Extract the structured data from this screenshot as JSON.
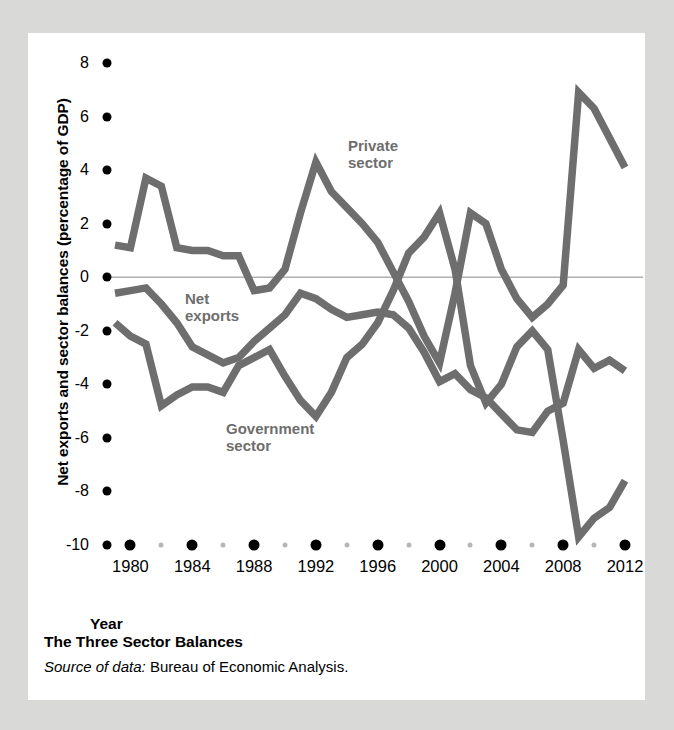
{
  "figure": {
    "caption_title": "The Three Sector Balances",
    "source_prefix": "Source of data:",
    "source_text": " Bureau of Economic Analysis."
  },
  "colors": {
    "page_background": "#d9d9d7",
    "card_background": "#ffffff",
    "line": "#6e6e6e",
    "zero_line": "#b0b0b0",
    "tick": "#000000",
    "minor_tick": "#b6b6b6",
    "annotation": "#6e6e6e"
  },
  "annotations": {
    "private_sector_line1": "Private",
    "private_sector_line2": "sector",
    "net_exports_line1": "Net",
    "net_exports_line2": "exports",
    "government_sector_line1": "Government",
    "government_sector_line2": "sector"
  },
  "chart_data": {
    "type": "line",
    "title": "The Three Sector Balances",
    "xlabel": "Year",
    "ylabel": "Net exports and sector balances (percentage of GDP)",
    "xlim": [
      1979,
      2012
    ],
    "ylim": [
      -10,
      8
    ],
    "ytick_values": [
      8,
      6,
      4,
      2,
      0,
      -2,
      -4,
      -6,
      -8,
      -10
    ],
    "ytick_labels": [
      "8",
      "6",
      "4",
      "2",
      "0",
      "-2",
      "-4",
      "-6",
      "-8",
      "-10"
    ],
    "xtick_major_labels": [
      "1980",
      "1984",
      "1988",
      "1992",
      "1996",
      "2000",
      "2004",
      "2008",
      "2012"
    ],
    "xtick_major_values": [
      1980,
      1984,
      1988,
      1992,
      1996,
      2000,
      2004,
      2008,
      2012
    ],
    "xtick_minor_values": [
      1982,
      1986,
      1990,
      1994,
      1998,
      2002,
      2006,
      2010
    ],
    "grid": false,
    "zero_reference_line": 0,
    "legend": "inline-annotations",
    "x": [
      1979,
      1980,
      1981,
      1982,
      1983,
      1984,
      1985,
      1986,
      1987,
      1988,
      1989,
      1990,
      1991,
      1992,
      1993,
      1994,
      1995,
      1996,
      1997,
      1998,
      1999,
      2000,
      2001,
      2002,
      2003,
      2004,
      2005,
      2006,
      2007,
      2008,
      2009,
      2010,
      2011,
      2012
    ],
    "series": [
      {
        "name": "Private sector",
        "values": [
          1.2,
          1.1,
          3.7,
          3.4,
          1.1,
          1.0,
          1.0,
          0.8,
          0.8,
          -0.5,
          -0.4,
          0.3,
          2.4,
          4.3,
          3.2,
          2.6,
          2.0,
          1.3,
          0.2,
          -0.9,
          -2.2,
          -3.2,
          -0.6,
          2.4,
          2.0,
          0.3,
          -0.8,
          -1.5,
          -1.0,
          -0.3,
          6.9,
          6.3,
          5.2,
          4.1
        ]
      },
      {
        "name": "Net exports",
        "values": [
          -0.6,
          -0.5,
          -0.4,
          -1.0,
          -1.7,
          -2.6,
          -2.9,
          -3.2,
          -3.0,
          -2.4,
          -1.9,
          -1.4,
          -0.6,
          -0.8,
          -1.2,
          -1.5,
          -1.4,
          -1.3,
          -1.4,
          -1.9,
          -2.8,
          -3.9,
          -3.6,
          -4.2,
          -4.5,
          -5.1,
          -5.7,
          -5.8,
          -5.0,
          -4.7,
          -2.7,
          -3.4,
          -3.1,
          -3.5
        ]
      },
      {
        "name": "Government sector",
        "values": [
          -1.7,
          -2.2,
          -2.5,
          -4.8,
          -4.4,
          -4.1,
          -4.1,
          -4.3,
          -3.3,
          -3.0,
          -2.7,
          -3.7,
          -4.6,
          -5.2,
          -4.3,
          -3.0,
          -2.5,
          -1.7,
          -0.5,
          0.9,
          1.5,
          2.4,
          0.3,
          -3.3,
          -4.7,
          -4.0,
          -2.6,
          -2.0,
          -2.7,
          -6.1,
          -9.7,
          -9.0,
          -8.6,
          -7.6
        ]
      }
    ]
  }
}
